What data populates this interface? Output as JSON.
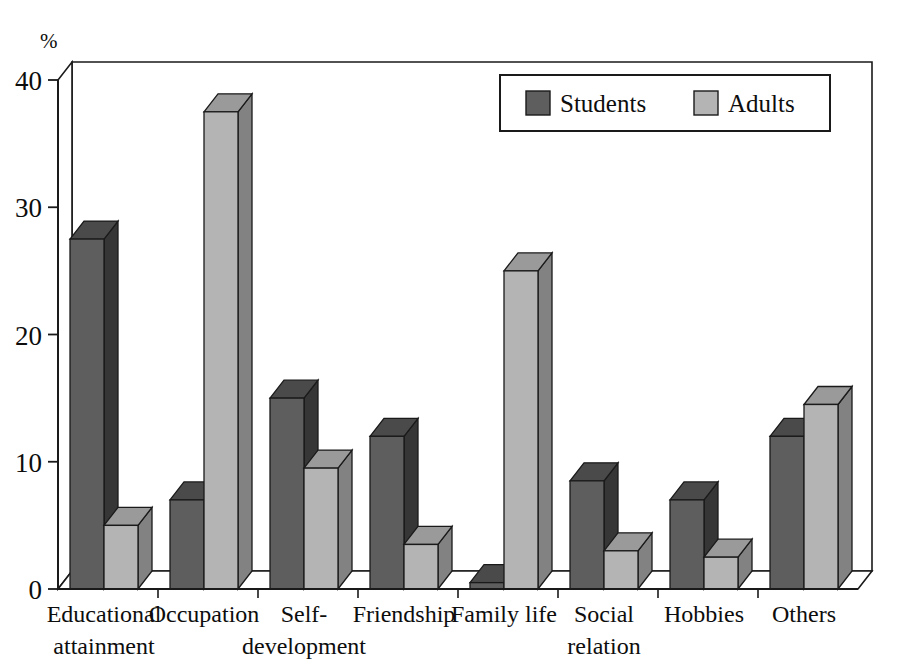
{
  "chart_data": {
    "type": "bar",
    "title": "",
    "subtitle": "",
    "xlabel": "",
    "ylabel": "%",
    "ylim": [
      0,
      40
    ],
    "yticks": [
      0,
      10,
      20,
      30,
      40
    ],
    "ytick_labels": [
      "0",
      "10",
      "20",
      "30",
      "40"
    ],
    "grid": true,
    "grid_style": "dotted horizontal gridlines at 10, 20, 30",
    "legend_position": "top-right inside plot area",
    "style": "3D grouped column chart, greyscale",
    "categories": [
      "Educational attainment",
      "Occupation",
      "Self-development",
      "Friendship",
      "Family life",
      "Social relation",
      "Hobbies",
      "Others"
    ],
    "category_lines": [
      [
        "Educational",
        "attainment"
      ],
      [
        "Occupation",
        ""
      ],
      [
        "Self-",
        "development"
      ],
      [
        "Friendship",
        ""
      ],
      [
        "Family life",
        ""
      ],
      [
        "Social",
        "relation"
      ],
      [
        "Hobbies",
        ""
      ],
      [
        "Others",
        ""
      ]
    ],
    "series": [
      {
        "name": "Students",
        "color": "#5e5e5e",
        "top_color": "#4a4a4a",
        "side_color": "#363636",
        "values": [
          27.5,
          7.0,
          15.0,
          12.0,
          0.5,
          8.5,
          7.0,
          12.0
        ]
      },
      {
        "name": "Adults",
        "color": "#b4b4b4",
        "top_color": "#9a9a9a",
        "side_color": "#828282",
        "values": [
          5.0,
          37.5,
          9.5,
          3.5,
          25.0,
          3.0,
          2.5,
          14.5
        ]
      }
    ]
  },
  "axis": {
    "unit_label": "%"
  },
  "legend": {
    "entries": [
      {
        "label": "Students",
        "swatch": "#5e5e5e"
      },
      {
        "label": "Adults",
        "swatch": "#b4b4b4"
      }
    ]
  }
}
